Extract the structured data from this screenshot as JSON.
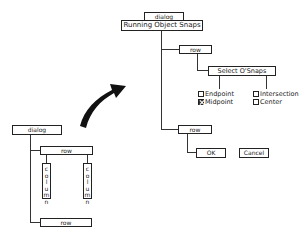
{
  "left_tree": {
    "dialog": "dialog",
    "row_top": "row",
    "columns": [
      {
        "label": [
          "c",
          "o",
          "l",
          "u",
          "m",
          "n"
        ]
      },
      {
        "label": [
          "c",
          "o",
          "l",
          "u",
          "m",
          "n"
        ]
      }
    ],
    "row_bottom": "row"
  },
  "right_tree": {
    "dialog": "dialog",
    "title": "Running Object Snaps",
    "row1": "row",
    "select_label": "Select O'Snaps",
    "checkboxes": [
      {
        "label": "Endpoint",
        "checked": false
      },
      {
        "label": "Midpoint",
        "checked": true
      },
      {
        "label": "Intersection",
        "checked": false
      },
      {
        "label": "Center",
        "checked": false
      }
    ],
    "row2": "row",
    "ok_label": "OK",
    "cancel_label": "Cancel"
  },
  "arrow": "curved-arrow"
}
